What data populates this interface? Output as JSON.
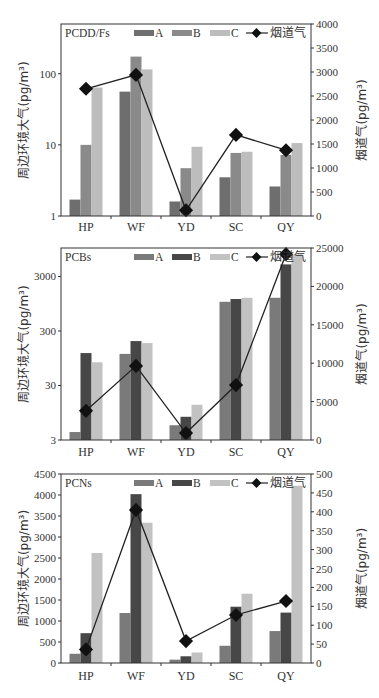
{
  "figure": {
    "panels": [
      "PCDD/Fs",
      "PCBs",
      "PCNs"
    ]
  },
  "chart_data": [
    {
      "type": "bar",
      "title": "PCDD/Fs",
      "categories": [
        "HP",
        "WF",
        "YD",
        "SC",
        "QY"
      ],
      "series": [
        {
          "name": "A",
          "kind": "bar",
          "axis": "left",
          "color": "#6e6e6e",
          "values": [
            1.7,
            56,
            1.6,
            3.5,
            2.6
          ]
        },
        {
          "name": "B",
          "kind": "bar",
          "axis": "left",
          "color": "#8a8a8a",
          "values": [
            10,
            174,
            4.7,
            7.7,
            7.2
          ]
        },
        {
          "name": "C",
          "kind": "bar",
          "axis": "left",
          "color": "#bdbdbd",
          "values": [
            64,
            115,
            9.4,
            8,
            10.6
          ]
        },
        {
          "name": "烟道气",
          "kind": "line",
          "axis": "right",
          "color": "#222222",
          "values": [
            2650,
            2940,
            120,
            1690,
            1370
          ]
        }
      ],
      "ylabel": "周边环境大气(pg/m³)",
      "y2label": "烟道气(pg/m³)",
      "yscale": "log",
      "ylim": [
        1,
        500
      ],
      "yticks": [
        1,
        10,
        100
      ],
      "ytick_labels": [
        "1",
        "10",
        "100"
      ],
      "y2lim": [
        0,
        4000
      ],
      "y2ticks": [
        0,
        500,
        1000,
        1500,
        2000,
        2500,
        3000,
        3500,
        4000
      ],
      "legend": [
        "A",
        "B",
        "C",
        "烟道气"
      ],
      "legend_position": "top",
      "grid": false
    },
    {
      "type": "bar",
      "title": "PCBs",
      "categories": [
        "HP",
        "WF",
        "YD",
        "SC",
        "QY"
      ],
      "series": [
        {
          "name": "A",
          "kind": "bar",
          "axis": "left",
          "color": "#7a7a7a",
          "values": [
            4.2,
            114,
            5.6,
            1030,
            1220
          ]
        },
        {
          "name": "B",
          "kind": "bar",
          "axis": "left",
          "color": "#474747",
          "values": [
            118,
            196,
            8.0,
            1160,
            5000
          ]
        },
        {
          "name": "C",
          "kind": "bar",
          "axis": "left",
          "color": "#c2c2c2",
          "values": [
            80,
            180,
            13.3,
            1220,
            7700
          ]
        },
        {
          "name": "烟道气",
          "kind": "line",
          "axis": "right",
          "color": "#222222",
          "values": [
            3800,
            9650,
            900,
            7150,
            24200
          ]
        }
      ],
      "ylabel": "周边环境大气(pg/m³)",
      "y2label": "烟道气(pg/m³)",
      "yscale": "log",
      "ylim": [
        3,
        10000
      ],
      "yticks": [
        3,
        30,
        300,
        3000
      ],
      "ytick_labels": [
        "3",
        "30",
        "300",
        "3000"
      ],
      "y2lim": [
        0,
        25000
      ],
      "y2ticks": [
        0,
        5000,
        10000,
        15000,
        20000,
        25000
      ],
      "legend": [
        "A",
        "B",
        "C",
        "烟道气"
      ],
      "legend_position": "top",
      "grid": false
    },
    {
      "type": "bar",
      "title": "PCNs",
      "categories": [
        "HP",
        "WF",
        "YD",
        "SC",
        "QY"
      ],
      "series": [
        {
          "name": "A",
          "kind": "bar",
          "axis": "left",
          "color": "#7a7a7a",
          "values": [
            220,
            1190,
            80,
            410,
            760
          ]
        },
        {
          "name": "B",
          "kind": "bar",
          "axis": "left",
          "color": "#474747",
          "values": [
            710,
            4020,
            160,
            1340,
            1200
          ]
        },
        {
          "name": "C",
          "kind": "bar",
          "axis": "left",
          "color": "#c2c2c2",
          "values": [
            2620,
            3340,
            250,
            1650,
            4220
          ]
        },
        {
          "name": "烟道气",
          "kind": "line",
          "axis": "right",
          "color": "#222222",
          "values": [
            36,
            405,
            58,
            127,
            164
          ]
        }
      ],
      "ylabel": "周边环境大气(pg/m³)",
      "y2label": "烟道气(pg/m³)",
      "yscale": "linear",
      "ylim": [
        0,
        4500
      ],
      "yticks": [
        0,
        500,
        1000,
        1500,
        2000,
        2500,
        3000,
        3500,
        4000,
        4500
      ],
      "ytick_labels": [
        "0",
        "500",
        "1000",
        "1500",
        "2000",
        "2500",
        "3000",
        "3500",
        "4000",
        "4500"
      ],
      "y2lim": [
        0,
        500
      ],
      "y2ticks": [
        0,
        50,
        100,
        150,
        200,
        250,
        300,
        350,
        400,
        450,
        500
      ],
      "legend": [
        "A",
        "B",
        "C",
        "烟道气"
      ],
      "legend_position": "top",
      "grid": false
    }
  ]
}
